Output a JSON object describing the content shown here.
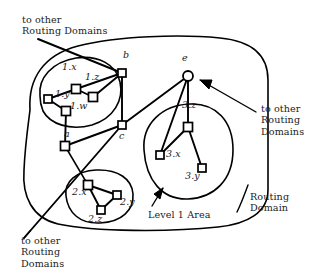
{
  "figure": {
    "type": "network-topology-diagram",
    "width": 316,
    "height": 271,
    "stroke_color": "#000000",
    "background_color": "#ffffff"
  },
  "annotations": {
    "top_left": "to other\nRouting Domains",
    "bottom_left": "to other\nRouting\nDomains",
    "right": "to other\nRouting\nDomains",
    "level_1_area": "Level 1 Area",
    "routing_domain": "Routing\nDomain"
  },
  "nodes": [
    {
      "id": "1.x",
      "label": "1.x",
      "shape": "square",
      "x": 76,
      "y": 89,
      "label_x": 64,
      "label_y": 70
    },
    {
      "id": "1.z",
      "label": "1.z",
      "shape": "square",
      "x": 93,
      "y": 97,
      "label_x": 87,
      "label_y": 80
    },
    {
      "id": "1.y",
      "label": "1.y",
      "shape": "square",
      "x": 48,
      "y": 99,
      "label_x": 58,
      "label_y": 93
    },
    {
      "id": "1.w",
      "label": "1.w",
      "shape": "square",
      "x": 66,
      "y": 111,
      "label_x": 72,
      "label_y": 105
    },
    {
      "id": "b",
      "label": "b",
      "shape": "square",
      "x": 122,
      "y": 73,
      "label_x": 124,
      "label_y": 56
    },
    {
      "id": "c",
      "label": "c",
      "shape": "square",
      "x": 122,
      "y": 125,
      "label_x": 121,
      "label_y": 128
    },
    {
      "id": "a",
      "label": "a",
      "shape": "square",
      "x": 65,
      "y": 146,
      "label_x": 66,
      "label_y": 131
    },
    {
      "id": "e",
      "label": "e",
      "shape": "circle",
      "x": 188,
      "y": 76,
      "label_x": 182,
      "label_y": 57
    },
    {
      "id": "3.z",
      "label": "3.z",
      "shape": "square",
      "x": 188,
      "y": 127,
      "label_x": 184,
      "label_y": 110
    },
    {
      "id": "3.x",
      "label": "3.x",
      "shape": "square",
      "x": 160,
      "y": 155,
      "label_x": 166,
      "label_y": 148
    },
    {
      "id": "3.y",
      "label": "3.y",
      "shape": "square",
      "x": 202,
      "y": 168,
      "label_x": 188,
      "label_y": 168
    },
    {
      "id": "2.x",
      "label": "2.x",
      "shape": "square",
      "x": 88,
      "y": 185,
      "label_x": 76,
      "label_y": 189
    },
    {
      "id": "2.y",
      "label": "2.y",
      "shape": "square",
      "x": 117,
      "y": 195,
      "label_x": 119,
      "label_y": 195
    },
    {
      "id": "2.z",
      "label": "2.z",
      "shape": "square",
      "x": 101,
      "y": 210,
      "label_x": 91,
      "label_y": 213
    }
  ],
  "links": [
    {
      "from": "1.x",
      "to": "1.z"
    },
    {
      "from": "1.x",
      "to": "1.y"
    },
    {
      "from": "1.y",
      "to": "1.w"
    },
    {
      "from": "1.z",
      "to": "b"
    },
    {
      "from": "1.x",
      "to": "b"
    },
    {
      "from": "1.w",
      "to": "a"
    },
    {
      "from": "b",
      "to": "c"
    },
    {
      "from": "a",
      "to": "c"
    },
    {
      "from": "a",
      "to": "2.x"
    },
    {
      "from": "c",
      "to": "e"
    },
    {
      "from": "e",
      "to": "3.x"
    },
    {
      "from": "e",
      "to": "3.z"
    },
    {
      "from": "3.z",
      "to": "3.x"
    },
    {
      "from": "3.z",
      "to": "3.y"
    },
    {
      "from": "2.x",
      "to": "2.y"
    },
    {
      "from": "2.x",
      "to": "2.z"
    },
    {
      "from": "2.y",
      "to": "2.z"
    }
  ],
  "areas": [
    {
      "id": "area-1",
      "label": "Level 1 Area (1.x group)"
    },
    {
      "id": "area-2",
      "label": "Level 1 Area (2.x group)"
    },
    {
      "id": "area-3",
      "label": "Level 1 Area (3.x group)"
    }
  ]
}
